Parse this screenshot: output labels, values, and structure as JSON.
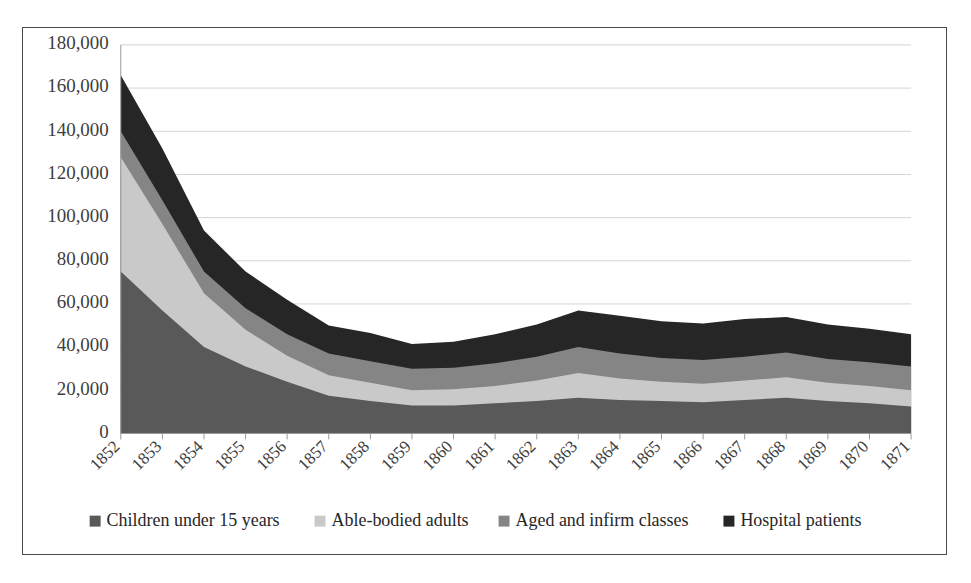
{
  "chart_data": {
    "type": "area",
    "stacked": true,
    "title": "",
    "xlabel": "",
    "ylabel": "",
    "grid": true,
    "legend_position": "bottom",
    "ylim": [
      0,
      180000
    ],
    "ytick_labels": [
      "0",
      "20,000",
      "40,000",
      "60,000",
      "80,000",
      "100,000",
      "120,000",
      "140,000",
      "160,000",
      "180,000"
    ],
    "ytick_values": [
      0,
      20000,
      40000,
      60000,
      80000,
      100000,
      120000,
      140000,
      160000,
      180000
    ],
    "categories": [
      "1852",
      "1853",
      "1854",
      "1855",
      "1856",
      "1857",
      "1858",
      "1859",
      "1860",
      "1861",
      "1862",
      "1863",
      "1864",
      "1865",
      "1866",
      "1867",
      "1868",
      "1869",
      "1870",
      "1871"
    ],
    "series": [
      {
        "name": "Children under 15 years",
        "color": "#595959",
        "values": [
          75000,
          57000,
          40000,
          31000,
          24000,
          17500,
          15000,
          13000,
          13000,
          14000,
          15000,
          16500,
          15500,
          15000,
          14500,
          15500,
          16500,
          15000,
          14000,
          12500
        ]
      },
      {
        "name": "Able-bodied adults",
        "color": "#c9c9c9",
        "values": [
          53000,
          40000,
          25000,
          17000,
          12000,
          9500,
          8500,
          7000,
          7500,
          8000,
          9500,
          11500,
          10000,
          9000,
          8500,
          9000,
          9500,
          8500,
          8000,
          7500
        ]
      },
      {
        "name": "Aged and infirm classes",
        "color": "#858585",
        "values": [
          12000,
          11000,
          10000,
          10000,
          10000,
          10000,
          10000,
          10000,
          10000,
          10500,
          11000,
          12000,
          11500,
          11000,
          11000,
          11000,
          11500,
          11000,
          11000,
          11000
        ]
      },
      {
        "name": "Hospital patients",
        "color": "#262626",
        "values": [
          26000,
          24000,
          19000,
          17000,
          16000,
          13000,
          13000,
          11500,
          12000,
          13500,
          15000,
          17000,
          17500,
          17000,
          17000,
          17500,
          16500,
          16000,
          15500,
          15000
        ]
      }
    ],
    "totals": [
      166000,
      132000,
      94000,
      75000,
      62000,
      50000,
      46500,
      41500,
      42500,
      46000,
      50500,
      57000,
      54500,
      52000,
      51000,
      53000,
      54000,
      50500,
      48500,
      46000
    ]
  },
  "legend": {
    "marker": "square-marker",
    "items": [
      {
        "label": "Children under 15 years",
        "color": "#595959"
      },
      {
        "label": "Able-bodied adults",
        "color": "#c9c9c9"
      },
      {
        "label": "Aged and infirm classes",
        "color": "#858585"
      },
      {
        "label": "Hospital patients",
        "color": "#262626"
      }
    ]
  }
}
